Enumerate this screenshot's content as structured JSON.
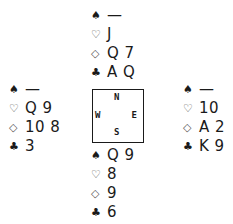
{
  "diagram": {
    "type": "bridge-deal",
    "hands": {
      "north": {
        "spades": "—",
        "hearts": "J",
        "diamonds": "Q 7",
        "clubs": "A Q"
      },
      "west": {
        "spades": "—",
        "hearts": "Q 9",
        "diamonds": "10 8",
        "clubs": "3"
      },
      "east": {
        "spades": "—",
        "hearts": "10",
        "diamonds": "A 2",
        "clubs": "K 9"
      },
      "south": {
        "spades": "Q 9",
        "hearts": "8",
        "diamonds": "9",
        "clubs": "6"
      }
    },
    "symbols": {
      "spades": "♠",
      "hearts": "♡",
      "diamonds": "◇",
      "clubs": "♣"
    },
    "compass": {
      "north": "N",
      "south": "S",
      "west": "W",
      "east": "E"
    }
  }
}
